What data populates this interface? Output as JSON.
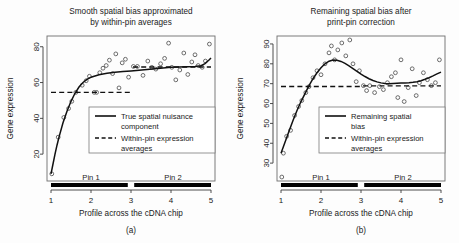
{
  "figure": {
    "width": 459,
    "height": 243,
    "background": "#ffffff",
    "ink": "#111111"
  },
  "chart_data": [
    {
      "id": "panel-a",
      "type": "scatter",
      "title": "Smooth spatial bias approximated by within-pin averages",
      "title_line1": "Smooth spatial bias approximated",
      "title_line2": "by within-pin averages",
      "caption": "(a)",
      "xlabel": "Profile across the cDNA chip",
      "ylabel": "Gene expression",
      "xlim": [
        0.9,
        5.1
      ],
      "ylim": [
        5,
        86
      ],
      "xticks": [
        1,
        2,
        3,
        4,
        5
      ],
      "yticks": [
        20,
        40,
        60,
        80
      ],
      "grid": false,
      "legend_position": "center-right",
      "series": [
        {
          "name": "True spatial nuisance component",
          "style": "solid",
          "x": [
            1.0,
            1.05,
            1.1,
            1.15,
            1.2,
            1.3,
            1.4,
            1.5,
            1.6,
            1.7,
            1.8,
            1.9,
            2.0,
            2.2,
            2.4,
            2.6,
            2.8,
            3.0,
            3.2,
            3.4,
            3.6,
            3.8,
            4.0,
            4.2,
            4.4,
            4.6,
            4.75,
            4.85,
            4.95,
            5.0
          ],
          "values": [
            9.0,
            14.5,
            20.0,
            25.0,
            29.5,
            37.5,
            44.0,
            49.5,
            54.0,
            57.5,
            60.0,
            61.8,
            63.0,
            64.4,
            65.2,
            65.7,
            66.1,
            66.5,
            66.9,
            67.3,
            67.7,
            68.1,
            68.5,
            68.7,
            68.8,
            68.9,
            69.4,
            70.6,
            72.6,
            73.7
          ]
        },
        {
          "name": "Within-pin expression averages",
          "style": "dashed",
          "segments": [
            {
              "x0": 1.0,
              "x1": 3.0,
              "y": 54.5
            },
            {
              "x0": 3.05,
              "x1": 5.0,
              "y": 68.7
            }
          ]
        }
      ],
      "points": [
        {
          "x": 1.02,
          "y": 9.0
        },
        {
          "x": 1.18,
          "y": 29.5
        },
        {
          "x": 1.32,
          "y": 40.5
        },
        {
          "x": 1.44,
          "y": 45.5
        },
        {
          "x": 1.52,
          "y": 49.5
        },
        {
          "x": 1.62,
          "y": 54.5
        },
        {
          "x": 1.78,
          "y": 58.5
        },
        {
          "x": 1.88,
          "y": 61.0
        },
        {
          "x": 1.96,
          "y": 63.5
        },
        {
          "x": 2.08,
          "y": 54.5
        },
        {
          "x": 2.14,
          "y": 54.5
        },
        {
          "x": 2.22,
          "y": 65.5
        },
        {
          "x": 2.3,
          "y": 68.0
        },
        {
          "x": 2.38,
          "y": 69.5
        },
        {
          "x": 2.46,
          "y": 72.5
        },
        {
          "x": 2.54,
          "y": 65.0
        },
        {
          "x": 2.62,
          "y": 76.0
        },
        {
          "x": 2.7,
          "y": 57.0
        },
        {
          "x": 2.78,
          "y": 71.0
        },
        {
          "x": 2.86,
          "y": 73.0
        },
        {
          "x": 2.94,
          "y": 63.0
        },
        {
          "x": 3.06,
          "y": 69.0
        },
        {
          "x": 3.16,
          "y": 69.0
        },
        {
          "x": 3.3,
          "y": 64.0
        },
        {
          "x": 3.42,
          "y": 72.0
        },
        {
          "x": 3.52,
          "y": 68.5
        },
        {
          "x": 3.62,
          "y": 67.5
        },
        {
          "x": 3.74,
          "y": 70.5
        },
        {
          "x": 3.84,
          "y": 73.5
        },
        {
          "x": 3.94,
          "y": 82.0
        },
        {
          "x": 4.02,
          "y": 68.5
        },
        {
          "x": 4.12,
          "y": 61.5
        },
        {
          "x": 4.22,
          "y": 67.0
        },
        {
          "x": 4.32,
          "y": 76.5
        },
        {
          "x": 4.42,
          "y": 64.5
        },
        {
          "x": 4.52,
          "y": 71.5
        },
        {
          "x": 4.6,
          "y": 75.5
        },
        {
          "x": 4.68,
          "y": 69.5
        },
        {
          "x": 4.78,
          "y": 68.5
        },
        {
          "x": 4.86,
          "y": 72.0
        },
        {
          "x": 4.96,
          "y": 81.5
        }
      ],
      "pins": [
        {
          "label": "Pin 1",
          "x0": 1.0,
          "x1": 2.92,
          "label_x": 2.0
        },
        {
          "label": "Pin 2",
          "x0": 3.08,
          "x1": 5.0,
          "label_x": 4.05
        }
      ],
      "legend": [
        {
          "label_line1": "True spatial nuisance",
          "label_line2": "component",
          "style": "solid"
        },
        {
          "label_line1": "Within-pin expression",
          "label_line2": "averages",
          "style": "dashed"
        }
      ]
    },
    {
      "id": "panel-b",
      "type": "scatter",
      "title": "Remaining spatial bias after print-pin correction",
      "title_line1": "Remaining spatial bias after",
      "title_line2": "print-pin correction",
      "caption": "(b)",
      "xlabel": "Profile across the cDNA chip",
      "ylabel": "Gene expression",
      "xlim": [
        0.9,
        5.1
      ],
      "ylim": [
        21,
        94
      ],
      "xticks": [
        1,
        2,
        3,
        4,
        5
      ],
      "yticks": [
        30,
        40,
        50,
        60,
        70,
        80,
        90
      ],
      "grid": false,
      "legend_position": "center-right",
      "series": [
        {
          "name": "Remaining spatial bias",
          "style": "solid",
          "x": [
            1.0,
            1.1,
            1.2,
            1.3,
            1.4,
            1.5,
            1.6,
            1.7,
            1.8,
            1.9,
            2.0,
            2.1,
            2.2,
            2.3,
            2.4,
            2.5,
            2.6,
            2.7,
            2.8,
            2.9,
            3.0,
            3.1,
            3.2,
            3.3,
            3.4,
            3.5,
            3.6,
            3.7,
            3.8,
            3.9,
            4.0,
            4.1,
            4.2,
            4.3,
            4.4,
            4.5,
            4.6,
            4.7,
            4.8,
            4.9,
            5.0
          ],
          "values": [
            35.0,
            40.5,
            46.0,
            51.5,
            56.5,
            61.0,
            65.0,
            69.0,
            72.5,
            75.5,
            78.0,
            80.0,
            81.3,
            81.9,
            81.8,
            81.2,
            80.2,
            79.0,
            77.6,
            76.2,
            74.8,
            73.6,
            72.5,
            71.6,
            70.9,
            70.4,
            70.1,
            70.0,
            70.1,
            70.2,
            70.3,
            70.4,
            70.5,
            70.7,
            71.0,
            71.5,
            72.2,
            73.0,
            73.9,
            74.9,
            75.8
          ]
        },
        {
          "name": "Within-pin expression averages",
          "style": "dashed",
          "segments": [
            {
              "x0": 1.0,
              "x1": 3.0,
              "y": 68.6
            },
            {
              "x0": 3.05,
              "x1": 5.0,
              "y": 68.9
            }
          ]
        }
      ],
      "points": [
        {
          "x": 1.02,
          "y": 23.0
        },
        {
          "x": 1.06,
          "y": 35.0
        },
        {
          "x": 1.14,
          "y": 43.5
        },
        {
          "x": 1.24,
          "y": 46.5
        },
        {
          "x": 1.34,
          "y": 54.0
        },
        {
          "x": 1.44,
          "y": 58.5
        },
        {
          "x": 1.52,
          "y": 61.5
        },
        {
          "x": 1.62,
          "y": 65.5
        },
        {
          "x": 1.7,
          "y": 68.5
        },
        {
          "x": 1.8,
          "y": 73.0
        },
        {
          "x": 1.9,
          "y": 76.5
        },
        {
          "x": 2.0,
          "y": 74.5
        },
        {
          "x": 2.1,
          "y": 80.0
        },
        {
          "x": 2.2,
          "y": 85.5
        },
        {
          "x": 2.26,
          "y": 89.0
        },
        {
          "x": 2.34,
          "y": 82.0
        },
        {
          "x": 2.42,
          "y": 87.0
        },
        {
          "x": 2.52,
          "y": 90.5
        },
        {
          "x": 2.62,
          "y": 84.0
        },
        {
          "x": 2.72,
          "y": 92.0
        },
        {
          "x": 2.8,
          "y": 80.0
        },
        {
          "x": 2.88,
          "y": 71.0
        },
        {
          "x": 2.96,
          "y": 76.5
        },
        {
          "x": 3.06,
          "y": 69.0
        },
        {
          "x": 3.14,
          "y": 66.5
        },
        {
          "x": 3.22,
          "y": 69.0
        },
        {
          "x": 3.34,
          "y": 65.5
        },
        {
          "x": 3.46,
          "y": 68.5
        },
        {
          "x": 3.56,
          "y": 67.0
        },
        {
          "x": 3.66,
          "y": 70.5
        },
        {
          "x": 3.76,
          "y": 73.5
        },
        {
          "x": 3.86,
          "y": 75.5
        },
        {
          "x": 3.92,
          "y": 63.0
        },
        {
          "x": 4.0,
          "y": 82.0
        },
        {
          "x": 4.08,
          "y": 61.0
        },
        {
          "x": 4.18,
          "y": 68.0
        },
        {
          "x": 4.28,
          "y": 77.5
        },
        {
          "x": 4.38,
          "y": 64.0
        },
        {
          "x": 4.46,
          "y": 70.5
        },
        {
          "x": 4.56,
          "y": 75.5
        },
        {
          "x": 4.66,
          "y": 72.0
        },
        {
          "x": 4.76,
          "y": 69.0
        },
        {
          "x": 4.86,
          "y": 70.5
        },
        {
          "x": 4.96,
          "y": 82.0
        }
      ],
      "pins": [
        {
          "label": "Pin 1",
          "x0": 1.0,
          "x1": 2.92,
          "label_x": 2.0
        },
        {
          "label": "Pin 2",
          "x0": 3.08,
          "x1": 5.0,
          "label_x": 4.05
        }
      ],
      "legend": [
        {
          "label_line1": "Remaining spatial",
          "label_line2": "bias",
          "style": "solid"
        },
        {
          "label_line1": "Within-pin expression",
          "label_line2": "averages",
          "style": "dashed"
        }
      ]
    }
  ]
}
